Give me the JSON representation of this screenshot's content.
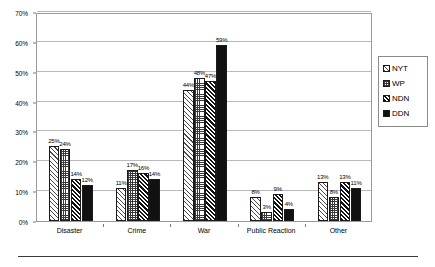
{
  "chart_data": {
    "type": "bar",
    "title": "",
    "subtitle": "",
    "xlabel": "",
    "ylabel": "",
    "categories": [
      "Disaster",
      "Crime",
      "War",
      "Public Reaction",
      "Other"
    ],
    "series": [
      {
        "name": "NYT",
        "values": [
          25,
          11,
          44,
          8,
          13
        ],
        "pattern": "light-diagonal-hatch"
      },
      {
        "name": "WP",
        "values": [
          24,
          17,
          48,
          3,
          8
        ],
        "pattern": "dotted-grid"
      },
      {
        "name": "NDN",
        "values": [
          14,
          16,
          47,
          9,
          13
        ],
        "pattern": "dense-diagonal-hatch"
      },
      {
        "name": "DDN",
        "values": [
          12,
          14,
          59,
          4,
          11
        ],
        "pattern": "solid-black"
      }
    ],
    "value_labels": [
      [
        "25%",
        "24%",
        "14%",
        "12%"
      ],
      [
        "11%",
        "17%",
        "16%",
        "14%"
      ],
      [
        "44%",
        "48%",
        "47%",
        "59%"
      ],
      [
        "8%",
        "3%",
        "9%",
        "4%"
      ],
      [
        "13%",
        "8%",
        "13%",
        "11%"
      ]
    ],
    "ylim": [
      0,
      70
    ],
    "ytick_values": [
      0,
      10,
      20,
      30,
      40,
      50,
      60,
      70
    ],
    "ytick_labels": [
      "0%",
      "10%",
      "20%",
      "30%",
      "40%",
      "50%",
      "60%",
      "70%"
    ],
    "grid": "horizontal",
    "legend_position": "right",
    "value_label_format": "percent"
  },
  "legend": {
    "entries": [
      {
        "label": "NYT"
      },
      {
        "label": "WP"
      },
      {
        "label": "NDN"
      },
      {
        "label": "DDN"
      }
    ]
  }
}
